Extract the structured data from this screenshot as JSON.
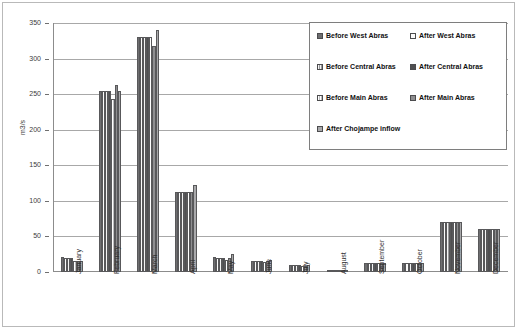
{
  "chart_data": {
    "type": "bar",
    "title": "",
    "xlabel": "",
    "ylabel": "m3/s",
    "ylim": [
      0,
      350
    ],
    "ytick_step": 50,
    "yticks": [
      0,
      50,
      100,
      150,
      200,
      250,
      300,
      350
    ],
    "grid": true,
    "legend_position": "upper-right-inside",
    "categories": [
      "January",
      "February",
      "March",
      "April",
      "May",
      "June",
      "July",
      "August",
      "September",
      "October",
      "November",
      "December"
    ],
    "series": [
      {
        "name": "Before West Abras",
        "color": "#6e6e70",
        "values": [
          21,
          254,
          331,
          113,
          21,
          16,
          10,
          3,
          13,
          13,
          71,
          61
        ]
      },
      {
        "name": "After West Abras",
        "color": "#fbfbfb",
        "values": [
          20,
          254,
          331,
          113,
          20,
          16,
          10,
          3,
          13,
          13,
          71,
          61
        ]
      },
      {
        "name": "Before Central Abras",
        "color": "#f4f4f4",
        "values": [
          20,
          254,
          331,
          113,
          20,
          16,
          10,
          3,
          13,
          13,
          71,
          61
        ]
      },
      {
        "name": "After Central Abras",
        "color": "#9a9a9c",
        "values": [
          20,
          254,
          331,
          113,
          20,
          16,
          10,
          3,
          13,
          13,
          71,
          61
        ]
      },
      {
        "name": "Before Main Abras",
        "color": "#4f4f51",
        "values": [
          16,
          243,
          331,
          113,
          17,
          14,
          9,
          2,
          12,
          12,
          70,
          60
        ]
      },
      {
        "name": "After Main Abras",
        "color": "#ffffff",
        "values": [
          15,
          263,
          318,
          113,
          19,
          15,
          9,
          2,
          12,
          12,
          70,
          60
        ]
      },
      {
        "name": "After Chojampe inflow",
        "color": "#a9a9ab",
        "values": [
          15,
          254,
          340,
          122,
          25,
          17,
          10,
          3,
          13,
          13,
          71,
          61
        ]
      }
    ],
    "legend": [
      {
        "label": "Before West Abras",
        "swatch": "s0"
      },
      {
        "label": "After West Abras",
        "swatch": "s1"
      },
      {
        "label": "Before Central Abras",
        "swatch": "s2"
      },
      {
        "label": "After Central Abras",
        "swatch": "s3"
      },
      {
        "label": "Before Main Abras",
        "swatch": "s4"
      },
      {
        "label": "After Main Abras",
        "swatch": "s5"
      },
      {
        "label": "After Chojampe inflow",
        "swatch": "s6"
      }
    ]
  }
}
